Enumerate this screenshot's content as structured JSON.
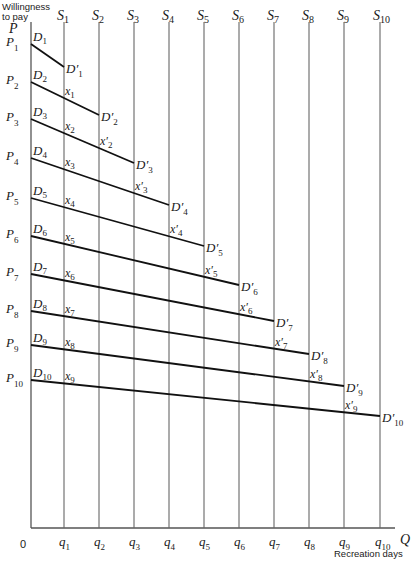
{
  "chart_data": {
    "type": "line",
    "title": "",
    "ylabel": "Willingness to pay",
    "ylabel_line1": "Willingness",
    "ylabel_line2": "to pay",
    "y_axis_symbol": "P",
    "xlabel": "Recreation days",
    "x_axis_symbol": "Q",
    "origin_label": "0",
    "supply_lines": [
      {
        "label": "S",
        "sub": "1",
        "x": 64
      },
      {
        "label": "S",
        "sub": "2",
        "x": 99
      },
      {
        "label": "S",
        "sub": "3",
        "x": 134
      },
      {
        "label": "S",
        "sub": "4",
        "x": 169
      },
      {
        "label": "S",
        "sub": "5",
        "x": 204
      },
      {
        "label": "S",
        "sub": "6",
        "x": 239
      },
      {
        "label": "S",
        "sub": "7",
        "x": 274
      },
      {
        "label": "S",
        "sub": "8",
        "x": 309
      },
      {
        "label": "S",
        "sub": "9",
        "x": 344
      },
      {
        "label": "S",
        "sub": "10",
        "x": 380
      }
    ],
    "x_ticks": [
      {
        "label": "q",
        "sub": "1"
      },
      {
        "label": "q",
        "sub": "2"
      },
      {
        "label": "q",
        "sub": "3"
      },
      {
        "label": "q",
        "sub": "4"
      },
      {
        "label": "q",
        "sub": "5"
      },
      {
        "label": "q",
        "sub": "6"
      },
      {
        "label": "q",
        "sub": "7"
      },
      {
        "label": "q",
        "sub": "8"
      },
      {
        "label": "q",
        "sub": "9"
      },
      {
        "label": "q",
        "sub": "10"
      }
    ],
    "demand_curves": [
      {
        "price": "P",
        "price_sub": "1",
        "start": "D",
        "start_sub": "1",
        "end": "D′",
        "end_sub": "1",
        "y_start": 44,
        "y_end": 67,
        "x_end_index": 1,
        "x_points": []
      },
      {
        "price": "P",
        "price_sub": "2",
        "start": "D",
        "start_sub": "2",
        "end": "D′",
        "end_sub": "2",
        "y_start": 82,
        "y_end": 115,
        "x_end_index": 2,
        "x_points": [
          {
            "label": "x",
            "sub": "1",
            "prime": false
          }
        ]
      },
      {
        "price": "P",
        "price_sub": "3",
        "start": "D",
        "start_sub": "3",
        "end": "D′",
        "end_sub": "3",
        "y_start": 119,
        "y_end": 163,
        "x_end_index": 3,
        "x_points": [
          {
            "label": "x",
            "sub": "2",
            "prime": false
          },
          {
            "label": "x",
            "sub": "2",
            "prime": true
          }
        ]
      },
      {
        "price": "P",
        "price_sub": "4",
        "start": "D",
        "start_sub": "4",
        "end": "D′",
        "end_sub": "4",
        "y_start": 158,
        "y_end": 205,
        "x_end_index": 4,
        "x_points": [
          {
            "label": "x",
            "sub": "3",
            "prime": false
          },
          {
            "label": "x",
            "sub": "3",
            "prime": true
          }
        ]
      },
      {
        "price": "P",
        "price_sub": "5",
        "start": "D",
        "start_sub": "5",
        "end": "D′",
        "end_sub": "5",
        "y_start": 198,
        "y_end": 246,
        "x_end_index": 5,
        "x_points": [
          {
            "label": "x",
            "sub": "4",
            "prime": false
          },
          {
            "label": "x",
            "sub": "4",
            "prime": true
          }
        ]
      },
      {
        "price": "P",
        "price_sub": "6",
        "start": "D",
        "start_sub": "6",
        "end": "D′",
        "end_sub": "6",
        "y_start": 236,
        "y_end": 285,
        "x_end_index": 6,
        "x_points": [
          {
            "label": "x",
            "sub": "5",
            "prime": false
          },
          {
            "label": "x",
            "sub": "5",
            "prime": true
          }
        ]
      },
      {
        "price": "P",
        "price_sub": "7",
        "start": "D",
        "start_sub": "7",
        "end": "D′",
        "end_sub": "7",
        "y_start": 274,
        "y_end": 321,
        "x_end_index": 7,
        "x_points": [
          {
            "label": "x",
            "sub": "6",
            "prime": false
          },
          {
            "label": "x",
            "sub": "6",
            "prime": true
          }
        ]
      },
      {
        "price": "P",
        "price_sub": "8",
        "start": "D",
        "start_sub": "8",
        "end": "D′",
        "end_sub": "8",
        "y_start": 311,
        "y_end": 354,
        "x_end_index": 8,
        "x_points": [
          {
            "label": "x",
            "sub": "7",
            "prime": false
          },
          {
            "label": "x",
            "sub": "7",
            "prime": true
          }
        ]
      },
      {
        "price": "P",
        "price_sub": "9",
        "start": "D",
        "start_sub": "9",
        "end": "D′",
        "end_sub": "9",
        "y_start": 345,
        "y_end": 386,
        "x_end_index": 9,
        "x_points": [
          {
            "label": "x",
            "sub": "8",
            "prime": false
          },
          {
            "label": "x",
            "sub": "8",
            "prime": true
          }
        ]
      },
      {
        "price": "P",
        "price_sub": "10",
        "start": "D",
        "start_sub": "10",
        "end": "D′",
        "end_sub": "10",
        "y_start": 380,
        "y_end": 416,
        "x_end_index": 10,
        "x_points": [
          {
            "label": "x",
            "sub": "9",
            "prime": false
          },
          {
            "label": "x",
            "sub": "9",
            "prime": true
          }
        ]
      }
    ],
    "layout": {
      "y_axis_x": 31,
      "x_axis_y": 528,
      "top_y": 22,
      "grid": false,
      "legend": "none"
    }
  }
}
